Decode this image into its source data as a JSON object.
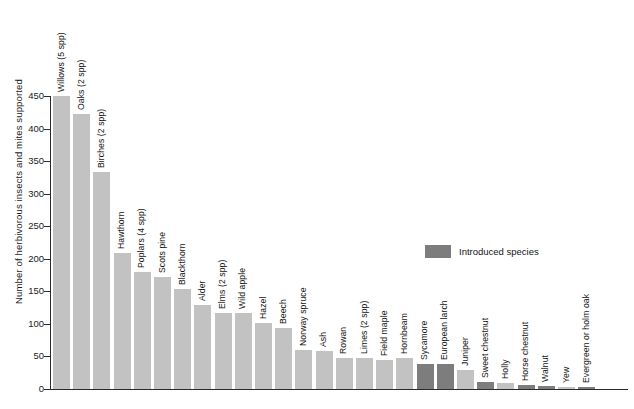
{
  "chart_data": {
    "type": "bar",
    "title": "",
    "xlabel": "",
    "ylabel": "Number of herbivorous insects and mites supported",
    "ylim": [
      0,
      450
    ],
    "ytick_values": [
      0,
      50,
      100,
      150,
      200,
      250,
      300,
      350,
      400,
      450
    ],
    "ytick_labels": [
      "0",
      "50",
      "100",
      "150",
      "200",
      "250",
      "300",
      "350",
      "400",
      "450"
    ],
    "grid": false,
    "legend": {
      "position": "inside-upper-right",
      "entries": [
        {
          "label": "Introduced species",
          "color": "#7d7d7d"
        }
      ]
    },
    "native_color": "#c2c2c2",
    "introduced_color": "#7d7d7d",
    "categories": [
      "Willows (5 spp)",
      "Oaks (2 spp)",
      "Birches (2 spp)",
      "Hawthorn",
      "Poplars (4 spp)",
      "Scots pine",
      "Blackthorn",
      "Alder",
      "Elms (2 spp)",
      "Wild apple",
      "Hazel",
      "Beech",
      "Norway spruce",
      "Ash",
      "Rowan",
      "Limes (2 spp)",
      "Field maple",
      "Hornbeam",
      "Sycamore",
      "European larch",
      "Juniper",
      "Sweet chestnut",
      "Holly",
      "Horse chestnut",
      "Walnut",
      "Yew",
      "Evergreen or holm oak"
    ],
    "values": [
      450,
      423,
      334,
      209,
      179,
      172,
      153,
      129,
      116,
      117,
      102,
      93,
      60,
      58,
      47,
      47,
      44,
      47,
      38,
      38,
      29,
      11,
      9,
      6,
      5,
      3,
      3
    ],
    "introduced": [
      false,
      false,
      false,
      false,
      false,
      false,
      false,
      false,
      false,
      false,
      false,
      false,
      false,
      false,
      false,
      false,
      false,
      false,
      true,
      true,
      false,
      true,
      false,
      true,
      true,
      false,
      true
    ]
  }
}
